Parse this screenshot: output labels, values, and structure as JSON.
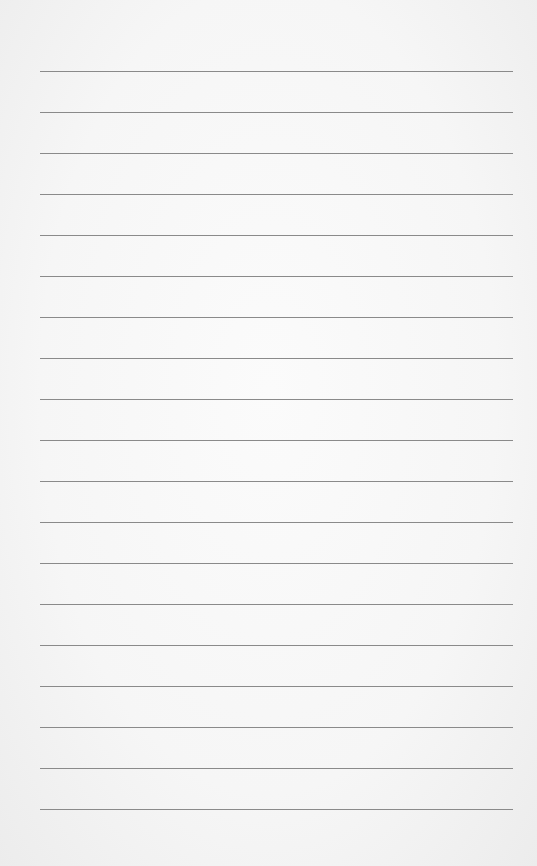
{
  "page": {
    "type": "lined-paper",
    "background_color": "#f6f6f6",
    "line_color": "#8a8a8a",
    "line_count": 19,
    "line_spacing_px": 41,
    "first_line_y": 71,
    "line_left_x": 40,
    "line_right_x": 513,
    "text_content": []
  }
}
